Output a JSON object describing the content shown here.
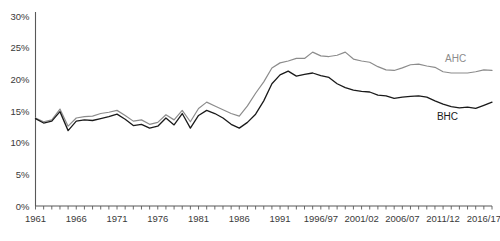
{
  "chart_data": {
    "type": "line",
    "title": "",
    "subtitle": "",
    "xlabel": "",
    "ylabel": "",
    "grid": false,
    "legend_position": "inline-right",
    "ylim": [
      0,
      30
    ],
    "y_ticks": [
      "0%",
      "5%",
      "10%",
      "15%",
      "20%",
      "25%",
      "30%"
    ],
    "y_tick_values": [
      0,
      5,
      10,
      15,
      20,
      25,
      30
    ],
    "x_ticks": [
      "1961",
      "1966",
      "1971",
      "1976",
      "1981",
      "1986",
      "1991",
      "1996/97",
      "2001/02",
      "2006/07",
      "2011/12",
      "2016/17"
    ],
    "x_tick_values": [
      1961,
      1966,
      1971,
      1976,
      1981,
      1986,
      1991,
      1996,
      2001,
      2006,
      2011,
      2016
    ],
    "x": [
      1961,
      1962,
      1963,
      1964,
      1965,
      1966,
      1967,
      1968,
      1969,
      1970,
      1971,
      1972,
      1973,
      1974,
      1975,
      1976,
      1977,
      1978,
      1979,
      1980,
      1981,
      1982,
      1983,
      1984,
      1985,
      1986,
      1987,
      1988,
      1989,
      1990,
      1991,
      1992,
      1993,
      1994,
      1995,
      1996,
      1997,
      1998,
      1999,
      2000,
      2001,
      2002,
      2003,
      2004,
      2005,
      2006,
      2007,
      2008,
      2009,
      2010,
      2011,
      2012,
      2013,
      2014,
      2015,
      2016,
      2017
    ],
    "series": [
      {
        "name": "AHC",
        "label": "AHC",
        "color": "#8c8c8c",
        "values": [
          13.9,
          13.3,
          13.6,
          15.3,
          12.6,
          13.9,
          14.1,
          14.2,
          14.6,
          14.8,
          15.1,
          14.3,
          13.4,
          13.6,
          12.9,
          13.2,
          14.4,
          13.6,
          15.1,
          13.3,
          15.4,
          16.4,
          15.8,
          15.2,
          14.6,
          14.2,
          15.8,
          17.8,
          19.6,
          21.8,
          22.6,
          22.9,
          23.3,
          23.3,
          24.3,
          23.7,
          23.6,
          23.8,
          24.3,
          23.2,
          22.9,
          22.7,
          22.0,
          21.5,
          21.4,
          21.8,
          22.3,
          22.4,
          22.1,
          21.9,
          21.2,
          21.0,
          21.0,
          21.0,
          21.2,
          21.5,
          21.4
        ]
      },
      {
        "name": "BHC",
        "label": "BHC",
        "color": "#1a1a1a",
        "values": [
          13.8,
          13.1,
          13.4,
          14.9,
          11.9,
          13.4,
          13.6,
          13.5,
          13.8,
          14.1,
          14.5,
          13.7,
          12.7,
          12.9,
          12.3,
          12.6,
          13.9,
          12.8,
          14.6,
          12.3,
          14.3,
          15.1,
          14.6,
          13.9,
          12.9,
          12.3,
          13.2,
          14.5,
          16.6,
          19.3,
          20.7,
          21.3,
          20.5,
          20.8,
          21.0,
          20.6,
          20.3,
          19.3,
          18.7,
          18.3,
          18.1,
          18.0,
          17.5,
          17.4,
          17.0,
          17.2,
          17.3,
          17.4,
          17.2,
          16.6,
          16.1,
          15.7,
          15.5,
          15.6,
          15.4,
          15.9,
          16.4
        ]
      }
    ]
  },
  "labels": {
    "ahc": "AHC",
    "bhc": "BHC"
  },
  "colors": {
    "ahc_line": "#8c8c8c",
    "bhc_line": "#1a1a1a",
    "axis": "#595959",
    "text": "#3a3a3a",
    "background": "#ffffff"
  }
}
